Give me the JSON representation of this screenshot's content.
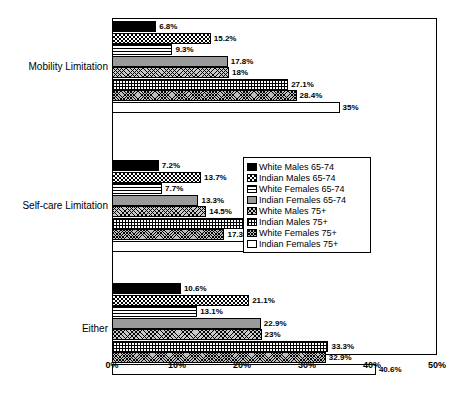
{
  "chart_data": {
    "type": "bar",
    "orientation": "horizontal",
    "title": "",
    "xlabel": "",
    "ylabel": "",
    "xlim": [
      0,
      50
    ],
    "xticks": [
      "0%",
      "10%",
      "20%",
      "30%",
      "40%",
      "50%"
    ],
    "xtick_values": [
      0,
      10,
      20,
      30,
      40,
      50
    ],
    "grid": false,
    "legend_position": "middle-right",
    "categories": [
      "Mobility Limitation",
      "Self-care Limitation",
      "Either"
    ],
    "series": [
      {
        "name": "White Males 65-74",
        "pattern": "solid-black",
        "values": [
          6.8,
          7.2,
          10.6
        ],
        "labels": [
          "6.8%",
          "7.2%",
          "10.6%"
        ]
      },
      {
        "name": "Indian Males 65-74",
        "pattern": "checkerboard",
        "values": [
          15.2,
          13.7,
          21.1
        ],
        "labels": [
          "15.2%",
          "13.7%",
          "21.1%"
        ]
      },
      {
        "name": "White Females 65-74",
        "pattern": "horizontal-lines",
        "values": [
          9.3,
          7.7,
          13.1
        ],
        "labels": [
          "9.3%",
          "7.7%",
          "13.1%"
        ]
      },
      {
        "name": "Indian Females 65-74",
        "pattern": "solid-gray",
        "values": [
          17.8,
          13.3,
          22.9
        ],
        "labels": [
          "17.8%",
          "13.3%",
          "22.9%"
        ]
      },
      {
        "name": "White Males 75+",
        "pattern": "diagonal-crosshatch",
        "values": [
          18,
          14.5,
          23
        ],
        "labels": [
          "18%",
          "14.5%",
          "23%"
        ]
      },
      {
        "name": "Indian Males 75+",
        "pattern": "grid",
        "values": [
          27.1,
          22.1,
          33.3
        ],
        "labels": [
          "27.1%",
          "22.1%",
          "33.3%"
        ]
      },
      {
        "name": "White Females 75+",
        "pattern": "dense-dots",
        "values": [
          28.4,
          17.3,
          32.9
        ],
        "labels": [
          "28.4%",
          "17.3%",
          "32.9%"
        ]
      },
      {
        "name": "Indian Females 75+",
        "pattern": "white",
        "values": [
          35,
          23.3,
          40.6
        ],
        "labels": [
          "35%",
          "23.3%",
          "40.6%"
        ]
      }
    ]
  },
  "legend": {
    "items": [
      {
        "label": "White Males 65-74"
      },
      {
        "label": "Indian Males 65-74"
      },
      {
        "label": "White Females 65-74"
      },
      {
        "label": "Indian Females 65-74"
      },
      {
        "label": "White Males 75+"
      },
      {
        "label": "Indian Males 75+"
      },
      {
        "label": "White Females 75+"
      },
      {
        "label": "Indian Females 75+"
      }
    ]
  },
  "colors": {
    "axis": "#000000",
    "background": "#ffffff",
    "gray_fill": "#9a9a9a"
  }
}
